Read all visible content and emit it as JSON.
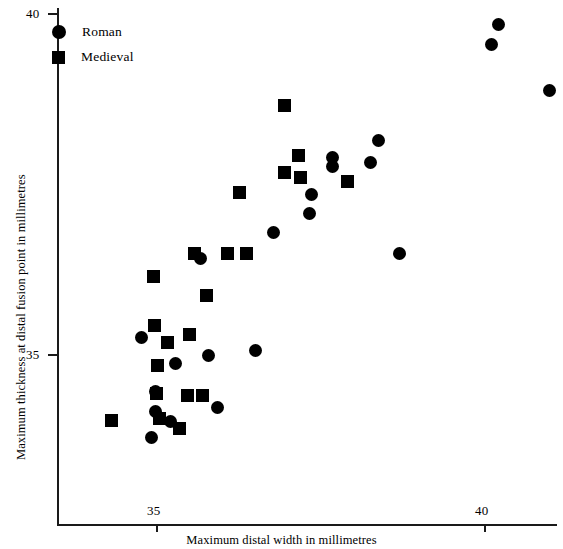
{
  "chart_data": {
    "type": "scatter",
    "title": "",
    "xlabel": "Maximum distal width in millimetres",
    "ylabel": "Maximum thickness at distal fusion point in millimetres",
    "xlim": [
      34.13,
      41.1
    ],
    "ylim": [
      33.5,
      40.09
    ],
    "xticks": [
      35,
      40
    ],
    "xticklabels": [
      "35",
      "40"
    ],
    "yticks": [
      35,
      40
    ],
    "yticklabels": [
      "35",
      "40"
    ],
    "grid": false,
    "legend_position": "top-left",
    "marker_color": "#000000",
    "series": [
      {
        "name": "Roman",
        "marker": "circle",
        "points": [
          [
            40.21,
            39.84
          ],
          [
            40.1,
            39.55
          ],
          [
            40.98,
            38.88
          ],
          [
            38.37,
            38.14
          ],
          [
            38.25,
            37.82
          ],
          [
            37.67,
            37.89
          ],
          [
            37.67,
            37.76
          ],
          [
            37.36,
            37.35
          ],
          [
            37.33,
            37.07
          ],
          [
            36.78,
            36.79
          ],
          [
            38.69,
            36.49
          ],
          [
            35.66,
            36.42
          ],
          [
            36.5,
            35.07
          ],
          [
            34.76,
            35.25
          ],
          [
            35.78,
            35.0
          ],
          [
            35.28,
            34.87
          ],
          [
            34.98,
            34.46
          ],
          [
            34.98,
            34.17
          ],
          [
            35.21,
            34.03
          ],
          [
            35.92,
            34.23
          ],
          [
            34.92,
            33.79
          ]
        ]
      },
      {
        "name": "Medieval",
        "marker": "square",
        "points": [
          [
            36.95,
            38.66
          ],
          [
            37.16,
            37.93
          ],
          [
            36.95,
            37.68
          ],
          [
            37.18,
            37.6
          ],
          [
            37.9,
            37.55
          ],
          [
            36.26,
            37.38
          ],
          [
            36.37,
            36.49
          ],
          [
            36.07,
            36.49
          ],
          [
            35.57,
            36.49
          ],
          [
            35.76,
            35.87
          ],
          [
            34.95,
            36.15
          ],
          [
            34.99,
            34.44
          ],
          [
            34.96,
            35.43
          ],
          [
            35.16,
            35.18
          ],
          [
            35.5,
            35.3
          ],
          [
            35.01,
            34.85
          ],
          [
            35.47,
            34.4
          ],
          [
            35.7,
            34.4
          ],
          [
            34.31,
            34.04
          ],
          [
            35.04,
            34.07
          ],
          [
            35.35,
            33.92
          ]
        ]
      }
    ]
  },
  "legend": {
    "items": [
      {
        "label": "Roman",
        "marker": "circle"
      },
      {
        "label": "Medieval",
        "marker": "square"
      }
    ]
  }
}
